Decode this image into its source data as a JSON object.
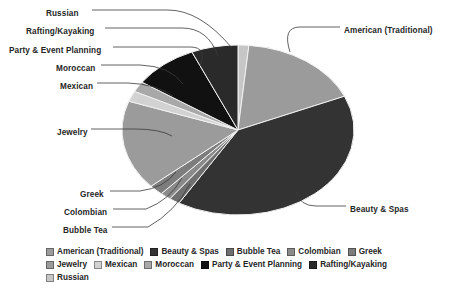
{
  "chart_data": {
    "type": "pie",
    "title": "",
    "legend_position": "bottom",
    "grid": false,
    "categories": [
      "American (Traditional)",
      "Beauty & Spas",
      "Bubble Tea",
      "Colombian",
      "Greek",
      "Jewelry",
      "Mexican",
      "Moroccan",
      "Party & Event Planning",
      "Rafting/Kayaking",
      "Russian"
    ],
    "values": [
      17.0,
      40.0,
      1.5,
      1.5,
      2.0,
      17.0,
      2.0,
      2.0,
      9.0,
      6.5,
      1.5
    ],
    "colors": [
      "#9b9b9b",
      "#333333",
      "#6f6f6f",
      "#8a8a8a",
      "#7d7d7d",
      "#9b9b9b",
      "#d2d2d2",
      "#a8a8a8",
      "#111111",
      "#2a2a2a",
      "#c6c6c6"
    ],
    "slices": [
      {
        "label": "Russian",
        "value": 1.5,
        "color": "#c6c6c6",
        "start_deg": 0.0,
        "end_deg": 5.4
      },
      {
        "label": "American (Traditional)",
        "value": 17.0,
        "color": "#9b9b9b",
        "start_deg": 5.4,
        "end_deg": 66.6
      },
      {
        "label": "Beauty & Spas",
        "value": 40.0,
        "color": "#333333",
        "start_deg": 66.6,
        "end_deg": 210.6
      },
      {
        "label": "Bubble Tea",
        "value": 1.5,
        "color": "#6f6f6f",
        "start_deg": 210.6,
        "end_deg": 216.0
      },
      {
        "label": "Colombian",
        "value": 1.5,
        "color": "#8a8a8a",
        "start_deg": 216.0,
        "end_deg": 221.4
      },
      {
        "label": "Greek",
        "value": 2.0,
        "color": "#7d7d7d",
        "start_deg": 221.4,
        "end_deg": 228.6
      },
      {
        "label": "Jewelry",
        "value": 17.0,
        "color": "#9b9b9b",
        "start_deg": 228.6,
        "end_deg": 289.8
      },
      {
        "label": "Mexican",
        "value": 2.0,
        "color": "#d2d2d2",
        "start_deg": 289.8,
        "end_deg": 297.0
      },
      {
        "label": "Moroccan",
        "value": 2.0,
        "color": "#a8a8a8",
        "start_deg": 297.0,
        "end_deg": 304.2
      },
      {
        "label": "Party & Event Planning",
        "value": 9.0,
        "color": "#111111",
        "start_deg": 304.2,
        "end_deg": 336.6
      },
      {
        "label": "Rafting/Kayaking",
        "value": 6.5,
        "color": "#2a2a2a",
        "start_deg": 336.6,
        "end_deg": 360.0
      }
    ]
  },
  "callouts": [
    {
      "name": "russian",
      "text": "Russian",
      "side": "left",
      "x": 46,
      "y": 9
    },
    {
      "name": "rafting-kayaking",
      "text": "Rafting/Kayaking",
      "side": "left",
      "x": 26,
      "y": 27
    },
    {
      "name": "party-event-planning",
      "text": "Party & Event Planning",
      "side": "left",
      "x": 9,
      "y": 46
    },
    {
      "name": "moroccan",
      "text": "Moroccan",
      "side": "left",
      "x": 56,
      "y": 64
    },
    {
      "name": "mexican",
      "text": "Mexican",
      "side": "left",
      "x": 60,
      "y": 82
    },
    {
      "name": "jewelry",
      "text": "Jewelry",
      "side": "left",
      "x": 57,
      "y": 128
    },
    {
      "name": "greek",
      "text": "Greek",
      "side": "left",
      "x": 80,
      "y": 190
    },
    {
      "name": "colombian",
      "text": "Colombian",
      "side": "left",
      "x": 64,
      "y": 208
    },
    {
      "name": "bubble-tea",
      "text": "Bubble Tea",
      "side": "left",
      "x": 63,
      "y": 226
    },
    {
      "name": "american-traditional",
      "text": "American (Traditional)",
      "side": "right",
      "x": 344,
      "y": 26
    },
    {
      "name": "beauty-spas",
      "text": "Beauty & Spas",
      "side": "right",
      "x": 350,
      "y": 205
    }
  ],
  "legend": {
    "items": [
      {
        "label": "American (Traditional)",
        "color": "#9b9b9b"
      },
      {
        "label": "Beauty & Spas",
        "color": "#333333"
      },
      {
        "label": "Bubble Tea",
        "color": "#6f6f6f"
      },
      {
        "label": "Colombian",
        "color": "#8a8a8a"
      },
      {
        "label": "Greek",
        "color": "#7d7d7d"
      },
      {
        "label": "Jewelry",
        "color": "#9b9b9b"
      },
      {
        "label": "Mexican",
        "color": "#d2d2d2"
      },
      {
        "label": "Moroccan",
        "color": "#a8a8a8"
      },
      {
        "label": "Party & Event Planning",
        "color": "#111111"
      },
      {
        "label": "Rafting/Kayaking",
        "color": "#2a2a2a"
      },
      {
        "label": "Russian",
        "color": "#c6c6c6"
      }
    ]
  }
}
